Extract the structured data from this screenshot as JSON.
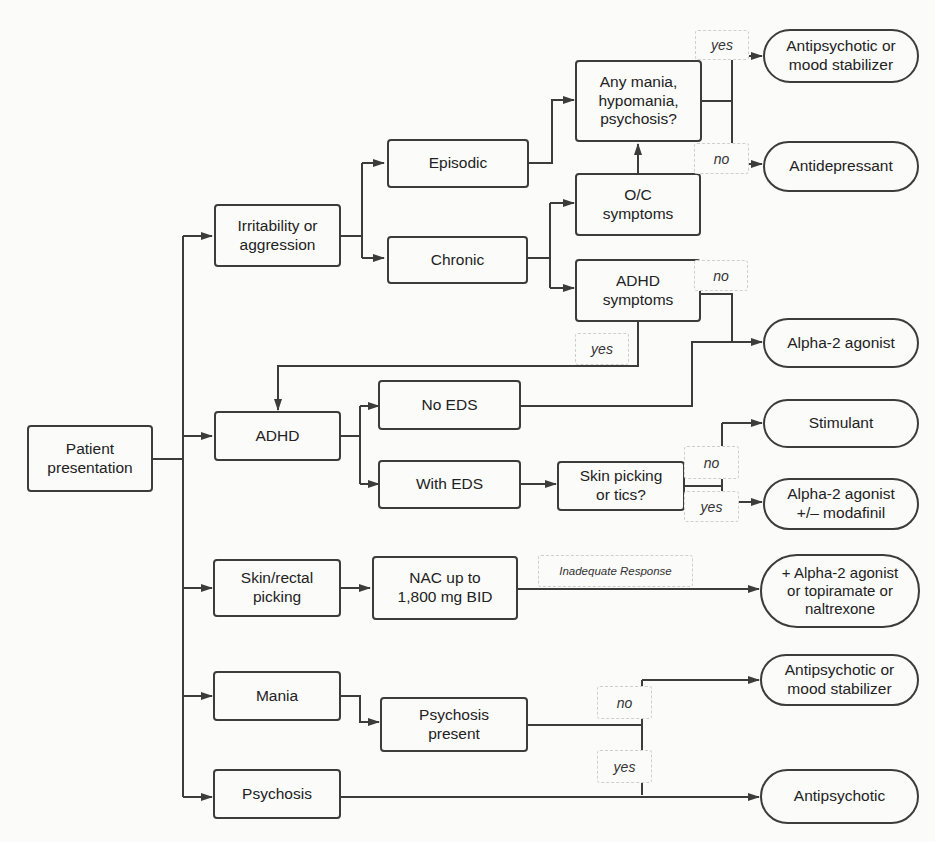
{
  "colors": {
    "line": "#3c3c3c",
    "background": "#fbfbfa",
    "label_border": "#cfcfcf"
  },
  "nodes": {
    "patient_presentation": "Patient\npresentation",
    "irritability": "Irritability or\naggression",
    "episodic": "Episodic",
    "chronic": "Chronic",
    "any_mania": "Any mania,\nhypomania,\npsychosis?",
    "oc_symptoms": "O/C\nsymptoms",
    "adhd_symptoms": "ADHD\nsymptoms",
    "adhd": "ADHD",
    "no_eds": "No EDS",
    "with_eds": "With EDS",
    "skin_picking_tics": "Skin picking\nor tics?",
    "skin_rectal": "Skin/rectal\npicking",
    "nac": "NAC up to\n1,800 mg BID",
    "mania": "Mania",
    "psychosis_present": "Psychosis\npresent",
    "psychosis": "Psychosis"
  },
  "outcomes": {
    "antipsychotic_or_mood_1": "Antipsychotic or\nmood stabilizer",
    "antidepressant": "Antidepressant",
    "alpha2_agonist": "Alpha-2 agonist",
    "stimulant": "Stimulant",
    "alpha2_modafinil": "Alpha-2 agonist\n+/– modafinil",
    "alpha2_topiramate": "+ Alpha-2 agonist\nor topiramate or\nnaltrexone",
    "antipsychotic_or_mood_2": "Antipsychotic or\nmood stabilizer",
    "antipsychotic": "Antipsychotic"
  },
  "edge_labels": {
    "mania_yes": "yes",
    "mania_no": "no",
    "adhd_no": "no",
    "adhd_yes": "yes",
    "tics_no": "no",
    "tics_yes": "yes",
    "inadequate_response": "Inadequate Response",
    "psychosis_no": "no",
    "psychosis_yes": "yes"
  }
}
